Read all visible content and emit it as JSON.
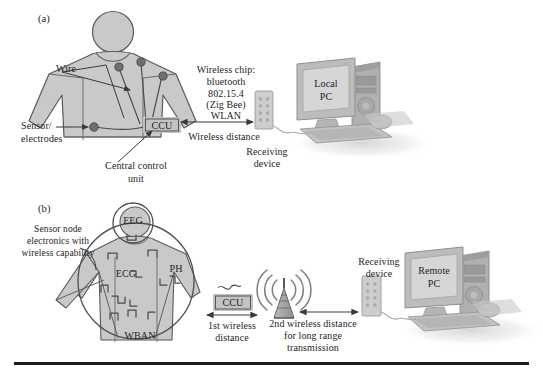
{
  "figure": {
    "panel_a": {
      "panel_label": "(a)",
      "labels": {
        "wire": "Wire",
        "sensor_electrodes_line1": "Sensor/",
        "sensor_electrodes_line2": "electrodes",
        "central_control_line1": "Central control",
        "central_control_line2": "unit",
        "ccu_box": "CCU",
        "wireless_chip_line1": "Wireless chip:",
        "wireless_chip_line2": "bluetooth",
        "wireless_chip_line3": "802.15.4",
        "wireless_chip_line4": "(Zig Bee)",
        "wireless_chip_line5": "WLAN",
        "wireless_distance": "Wireless distance",
        "receiving_device_line1": "Receiving",
        "receiving_device_line2": "device",
        "local_pc_line1": "Local",
        "local_pc_line2": "PC"
      }
    },
    "panel_b": {
      "panel_label": "(b)",
      "labels": {
        "sensor_node_line1": "Sensor node",
        "sensor_node_line2": "electronics with",
        "sensor_node_line3": "wireless capability",
        "eeg": "EEG",
        "ecg": "ECG",
        "ph": "PH",
        "wban": "WBAN",
        "ccu_box": "CCU",
        "first_distance_line1": "1st wireless",
        "first_distance_line2": "distance",
        "second_distance_line1": "2nd wireless distance",
        "second_distance_line2": "for long range",
        "second_distance_line3": "transmission",
        "receiving_device_line1": "Receiving",
        "receiving_device_line2": "device",
        "remote_pc_line1": "Remote",
        "remote_pc_line2": "PC"
      }
    },
    "colors": {
      "ink": "#242424",
      "body_fill": "#c9c9c9",
      "body_stroke": "#555555",
      "device_fill": "#c4c4c4",
      "pc_fill": "#b8b8b8",
      "rule": "#1c1c1c",
      "background": "#ffffff"
    }
  }
}
